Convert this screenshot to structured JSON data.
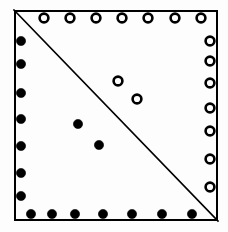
{
  "figure": {
    "background_color": "#fdfdfd",
    "stroke_color": "#000000",
    "square": {
      "x": 14,
      "y": 10,
      "width": 204,
      "height": 211,
      "border_width": 2
    },
    "diagonal": {
      "label": "main-diagonal",
      "x1": 14,
      "y1": 10,
      "x2": 218,
      "y2": 221,
      "stroke_width": 1.6
    },
    "markers": {
      "filled": {
        "label": "filled-dot",
        "fill": "#000000",
        "stroke": "#000000",
        "radius": 4.6
      },
      "open": {
        "label": "open-circle",
        "fill": "#fdfdfd",
        "stroke": "#000000",
        "radius": 4.4,
        "stroke_width": 2.6
      }
    },
    "groups": [
      {
        "name": "top-edge-open-circles",
        "type": "open",
        "count": 7,
        "points": [
          {
            "x": 44,
            "y": 18
          },
          {
            "x": 70,
            "y": 18
          },
          {
            "x": 96,
            "y": 18
          },
          {
            "x": 122,
            "y": 18
          },
          {
            "x": 148,
            "y": 18
          },
          {
            "x": 175,
            "y": 18
          },
          {
            "x": 201,
            "y": 18
          }
        ]
      },
      {
        "name": "right-edge-open-circles",
        "type": "open",
        "count": 7,
        "points": [
          {
            "x": 210,
            "y": 41
          },
          {
            "x": 210,
            "y": 61
          },
          {
            "x": 210,
            "y": 83
          },
          {
            "x": 210,
            "y": 108
          },
          {
            "x": 210,
            "y": 131
          },
          {
            "x": 210,
            "y": 159
          },
          {
            "x": 210,
            "y": 187
          }
        ]
      },
      {
        "name": "left-edge-filled-dots",
        "type": "filled",
        "count": 7,
        "points": [
          {
            "x": 21,
            "y": 41
          },
          {
            "x": 21,
            "y": 64
          },
          {
            "x": 21,
            "y": 93
          },
          {
            "x": 21,
            "y": 119
          },
          {
            "x": 21,
            "y": 146
          },
          {
            "x": 21,
            "y": 173
          },
          {
            "x": 21,
            "y": 196
          }
        ]
      },
      {
        "name": "bottom-edge-filled-dots",
        "type": "filled",
        "count": 7,
        "points": [
          {
            "x": 31,
            "y": 214
          },
          {
            "x": 52,
            "y": 214
          },
          {
            "x": 75,
            "y": 214
          },
          {
            "x": 103,
            "y": 214
          },
          {
            "x": 132,
            "y": 214
          },
          {
            "x": 162,
            "y": 214
          },
          {
            "x": 192,
            "y": 214
          }
        ]
      },
      {
        "name": "interior-open-circles",
        "type": "open",
        "count": 2,
        "points": [
          {
            "x": 118,
            "y": 81
          },
          {
            "x": 137,
            "y": 99
          }
        ]
      },
      {
        "name": "interior-filled-dots",
        "type": "filled",
        "count": 2,
        "points": [
          {
            "x": 78,
            "y": 124
          },
          {
            "x": 99,
            "y": 145
          }
        ]
      }
    ]
  }
}
